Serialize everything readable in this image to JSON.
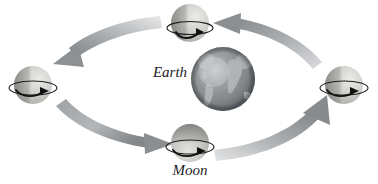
{
  "figure": {
    "background_color": "#ffffff",
    "width": 378,
    "height": 184
  },
  "labels": {
    "earth": "Earth",
    "moon": "Moon"
  },
  "bodies": {
    "earth": {
      "name": "Earth",
      "cx": 223,
      "cy": 79,
      "r": 32,
      "base_color": "#8d9195",
      "highlight_color": "#cfd2d3",
      "shadow_color": "#5b6064",
      "land_color": "#b9bdbe"
    },
    "moons": [
      {
        "position_name": "moon-top",
        "cx": 190,
        "cy": 23,
        "r": 19,
        "light_side": "right",
        "base_color": "#c8c9c5",
        "lit_color": "#dedfdb",
        "dark_color": "#a9aaa6",
        "ring_color": "#1d1d1d",
        "spin_arrow_direction": "right"
      },
      {
        "position_name": "moon-left",
        "cx": 33,
        "cy": 85,
        "r": 19,
        "light_side": "right",
        "base_color": "#c3c4c0",
        "lit_color": "#e0e1dd",
        "dark_color": "#9b9c98",
        "ring_color": "#1d1d1d",
        "spin_arrow_direction": "right"
      },
      {
        "position_name": "moon-bottom",
        "cx": 190,
        "cy": 143,
        "r": 19,
        "light_side": "bottom",
        "base_color": "#b6b7b3",
        "lit_color": "#d9dad6",
        "dark_color": "#8f908c",
        "ring_color": "#1d1d1d",
        "spin_arrow_direction": "right"
      },
      {
        "position_name": "moon-right",
        "cx": 344,
        "cy": 85,
        "r": 19,
        "light_side": "right",
        "base_color": "#c6c7c3",
        "lit_color": "#e2e3df",
        "dark_color": "#a2a39f",
        "ring_color": "#1d1d1d",
        "spin_arrow_direction": "right"
      }
    ]
  },
  "orbit": {
    "direction": "counterclockwise",
    "arrow_color_light": "#c9cbcc",
    "arrow_color_dark": "#85898c",
    "segments": [
      {
        "name": "orbit-arrow-top-left",
        "from": "moon-top",
        "to": "moon-left",
        "points": "down-left"
      },
      {
        "name": "orbit-arrow-bottom-left",
        "from": "moon-left",
        "to": "moon-bottom",
        "points": "right"
      },
      {
        "name": "orbit-arrow-bottom-right",
        "from": "moon-bottom",
        "to": "moon-right",
        "points": "up-right"
      },
      {
        "name": "orbit-arrow-top-right",
        "from": "moon-right",
        "to": "moon-top",
        "points": "left"
      }
    ]
  },
  "label_positions": {
    "earth": {
      "x": 170,
      "y": 77,
      "anchor": "middle"
    },
    "moon": {
      "x": 190,
      "y": 175,
      "anchor": "middle"
    }
  }
}
